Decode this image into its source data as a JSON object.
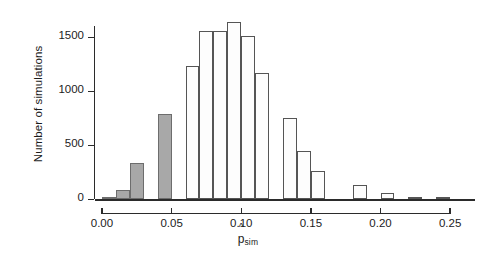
{
  "figure": {
    "background": "#ffffff",
    "axis_color": "#2b2b2b"
  },
  "axes": {
    "ylabel": "Number of simulations",
    "xlabel_base": "p",
    "xlabel_hat": "^",
    "xlabel_sub": "sim",
    "ytick_labels": [
      "0",
      "500",
      "1000",
      "1500"
    ],
    "xtick_labels": [
      "0.00",
      "0.05",
      "0.10",
      "0.15",
      "0.20",
      "0.25"
    ]
  },
  "chart_data": {
    "type": "bar",
    "title": "",
    "xlabel": "p̂_sim",
    "ylabel": "Number of simulations",
    "xlim": [
      -0.005,
      0.275
    ],
    "ylim": [
      0,
      1700
    ],
    "yticks": [
      0,
      500,
      1000,
      1500
    ],
    "xticks": [
      0.0,
      0.05,
      0.1,
      0.15,
      0.2,
      0.25
    ],
    "grid": false,
    "legend": null,
    "bin_width": 0.01,
    "bar_style": {
      "shaded_fill": "#a8a8a8",
      "shaded_edge": "#6d6d6d",
      "open_fill": "#fdfdfd",
      "open_edge": "#555555"
    },
    "shaded_note": "bins with bin_center <= 0.05 are shaded gray (tail region)",
    "bins": [
      {
        "bin_start": 0.0,
        "bin_end": 0.01,
        "center": 0.005,
        "value": 25,
        "shaded": true
      },
      {
        "bin_start": 0.01,
        "bin_end": 0.02,
        "center": 0.015,
        "value": 90,
        "shaded": true
      },
      {
        "bin_start": 0.02,
        "bin_end": 0.03,
        "center": 0.025,
        "value": 335,
        "shaded": true
      },
      {
        "bin_start": 0.03,
        "bin_end": 0.04,
        "center": 0.035,
        "value": 0,
        "shaded": true
      },
      {
        "bin_start": 0.04,
        "bin_end": 0.05,
        "center": 0.045,
        "value": 790,
        "shaded": true
      },
      {
        "bin_start": 0.05,
        "bin_end": 0.06,
        "center": 0.055,
        "value": 0,
        "shaded": false
      },
      {
        "bin_start": 0.06,
        "bin_end": 0.07,
        "center": 0.065,
        "value": 1230,
        "shaded": false
      },
      {
        "bin_start": 0.07,
        "bin_end": 0.08,
        "center": 0.075,
        "value": 1555,
        "shaded": false
      },
      {
        "bin_start": 0.08,
        "bin_end": 0.09,
        "center": 0.085,
        "value": 1560,
        "shaded": false
      },
      {
        "bin_start": 0.09,
        "bin_end": 0.1,
        "center": 0.095,
        "value": 1645,
        "shaded": false
      },
      {
        "bin_start": 0.1,
        "bin_end": 0.11,
        "center": 0.105,
        "value": 1510,
        "shaded": false
      },
      {
        "bin_start": 0.11,
        "bin_end": 0.12,
        "center": 0.115,
        "value": 1170,
        "shaded": false
      },
      {
        "bin_start": 0.12,
        "bin_end": 0.13,
        "center": 0.125,
        "value": 0,
        "shaded": false
      },
      {
        "bin_start": 0.13,
        "bin_end": 0.14,
        "center": 0.135,
        "value": 755,
        "shaded": false
      },
      {
        "bin_start": 0.14,
        "bin_end": 0.15,
        "center": 0.145,
        "value": 450,
        "shaded": false
      },
      {
        "bin_start": 0.15,
        "bin_end": 0.16,
        "center": 0.155,
        "value": 265,
        "shaded": false
      },
      {
        "bin_start": 0.16,
        "bin_end": 0.17,
        "center": 0.165,
        "value": 0,
        "shaded": false
      },
      {
        "bin_start": 0.17,
        "bin_end": 0.18,
        "center": 0.175,
        "value": 0,
        "shaded": false
      },
      {
        "bin_start": 0.18,
        "bin_end": 0.19,
        "center": 0.185,
        "value": 135,
        "shaded": false
      },
      {
        "bin_start": 0.19,
        "bin_end": 0.2,
        "center": 0.195,
        "value": 0,
        "shaded": false
      },
      {
        "bin_start": 0.2,
        "bin_end": 0.21,
        "center": 0.205,
        "value": 60,
        "shaded": false
      },
      {
        "bin_start": 0.21,
        "bin_end": 0.22,
        "center": 0.215,
        "value": 0,
        "shaded": false
      },
      {
        "bin_start": 0.22,
        "bin_end": 0.23,
        "center": 0.225,
        "value": 25,
        "shaded": false
      },
      {
        "bin_start": 0.23,
        "bin_end": 0.24,
        "center": 0.235,
        "value": 0,
        "shaded": false
      },
      {
        "bin_start": 0.24,
        "bin_end": 0.25,
        "center": 0.245,
        "value": 10,
        "shaded": false
      }
    ]
  }
}
